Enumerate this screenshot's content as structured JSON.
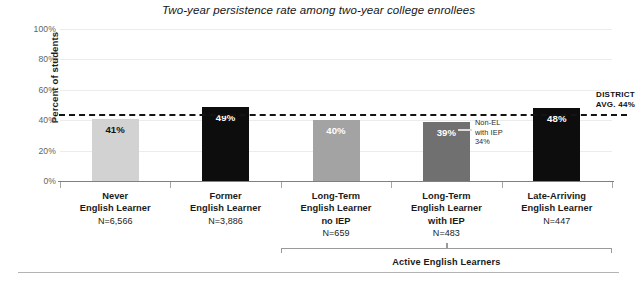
{
  "chart_data": {
    "type": "bar",
    "title": "Two-year persistence rate among two-year college enrollees",
    "xlabel": "",
    "ylabel": "Percent of students",
    "ylim": [
      0,
      100
    ],
    "yticks": [
      "0%",
      "20%",
      "40%",
      "60%",
      "80%",
      "100%"
    ],
    "ytick_values": [
      0,
      20,
      40,
      60,
      80,
      100
    ],
    "grid": true,
    "legend": "none",
    "categories": [
      "Never English Learner",
      "Former English Learner",
      "Long-Term English Learner no IEP",
      "Long-Term English Learner with IEP",
      "Late-Arriving English Learner"
    ],
    "values": [
      41,
      49,
      40,
      39,
      48
    ],
    "value_labels": [
      "41%",
      "49%",
      "40%",
      "39%",
      "48%"
    ],
    "bars": [
      {
        "line1": "Never",
        "line2": "English Learner",
        "line3": "",
        "n_label": "N=6,566",
        "value": 41,
        "value_label": "41%",
        "color": "#d2d2d2",
        "text_color": "#111111"
      },
      {
        "line1": "Former",
        "line2": "English Learner",
        "line3": "",
        "n_label": "N=3,886",
        "value": 49,
        "value_label": "49%",
        "color": "#0d0d0d",
        "text_color": "#ffffff"
      },
      {
        "line1": "Long-Term",
        "line2": "English Learner",
        "line3": "no IEP",
        "n_label": "N=659",
        "value": 40,
        "value_label": "40%",
        "color": "#a3a3a3",
        "text_color": "#ffffff"
      },
      {
        "line1": "Long-Term",
        "line2": "English Learner",
        "line3": "with IEP",
        "n_label": "N=483",
        "value": 39,
        "value_label": "39%",
        "color": "#707070",
        "text_color": "#ffffff"
      },
      {
        "line1": "Late-Arriving",
        "line2": "English Learner",
        "line3": "",
        "n_label": "N=447",
        "value": 48,
        "value_label": "48%",
        "color": "#0d0d0d",
        "text_color": "#ffffff"
      }
    ],
    "reference_line": {
      "value": 44,
      "label_line1": "DISTRICT",
      "label_line2": "AVG. 44%",
      "style": "dashed",
      "color": "#141414"
    },
    "annotations": [
      {
        "text": "Non-EL\nwith IEP\n34%",
        "value": 34,
        "attached_to_category": "Long-Term English Learner with IEP"
      }
    ],
    "group_bracket": {
      "label": "Active English Learners",
      "spans": [
        "Long-Term English Learner no IEP",
        "Long-Term English Learner with IEP",
        "Late-Arriving English Learner"
      ]
    }
  }
}
